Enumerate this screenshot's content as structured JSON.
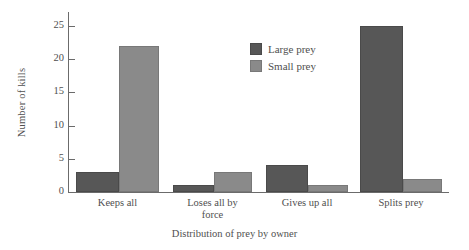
{
  "chart_data": {
    "type": "bar",
    "title": "",
    "xlabel": "Distribution of prey by owner",
    "ylabel": "Number of kills",
    "categories": [
      "Keeps all",
      "Loses all by force",
      "Gives up all",
      "Splits prey"
    ],
    "category_lines": [
      [
        "Keeps all"
      ],
      [
        "Loses all by",
        "force"
      ],
      [
        "Gives up all"
      ],
      [
        "Splits prey"
      ]
    ],
    "series": [
      {
        "name": "Large prey",
        "color": "#575757",
        "values": [
          3,
          1,
          4,
          25
        ]
      },
      {
        "name": "Small prey",
        "color": "#8a8a8a",
        "values": [
          22,
          3,
          1,
          2
        ]
      }
    ],
    "ylim": [
      0,
      25
    ],
    "yticks": [
      0,
      5,
      10,
      15,
      20,
      25
    ],
    "ytick_labels": [
      "0",
      "5",
      "10",
      "15",
      "20",
      "25"
    ],
    "grid": false,
    "legend_position": "inside-top-center",
    "legend": [
      "Large prey",
      "Small prey"
    ]
  },
  "axis": {
    "y_label": "Number of kills",
    "x_label": "Distribution of prey by owner"
  }
}
